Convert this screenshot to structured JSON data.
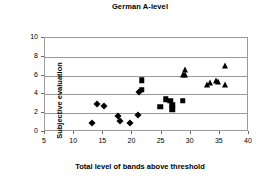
{
  "chart_data": {
    "type": "scatter",
    "title": "German A-level",
    "xlabel": "Total level of bands above threshold",
    "ylabel": "Subjective evaluation",
    "xlim": [
      5,
      40
    ],
    "ylim": [
      0,
      10
    ],
    "xticks": [
      5,
      10,
      15,
      20,
      25,
      30,
      35,
      40
    ],
    "yticks": [
      0,
      2,
      4,
      6,
      8,
      10
    ],
    "grid": "horizontal",
    "legend": "none",
    "series": [
      {
        "name": "diamond-group",
        "marker": "diamond",
        "points": [
          [
            13.0,
            1.0
          ],
          [
            14.0,
            3.0
          ],
          [
            15.2,
            2.8
          ],
          [
            17.6,
            1.7
          ],
          [
            17.9,
            1.2
          ],
          [
            19.5,
            1.0
          ],
          [
            20.9,
            1.8
          ],
          [
            21.1,
            4.3
          ]
        ]
      },
      {
        "name": "square-group",
        "marker": "square",
        "points": [
          [
            21.6,
            5.5
          ],
          [
            21.6,
            4.5
          ],
          [
            24.8,
            2.7
          ],
          [
            25.7,
            3.5
          ],
          [
            26.5,
            3.3
          ],
          [
            26.8,
            2.9
          ],
          [
            26.8,
            2.4
          ],
          [
            28.6,
            3.3
          ]
        ]
      },
      {
        "name": "triangle-group",
        "marker": "triangle",
        "points": [
          [
            28.7,
            6.1
          ],
          [
            29.0,
            6.6
          ],
          [
            29.1,
            6.1
          ],
          [
            32.8,
            5.0
          ],
          [
            33.3,
            5.2
          ],
          [
            34.3,
            5.4
          ],
          [
            34.6,
            5.3
          ],
          [
            35.8,
            5.0
          ],
          [
            35.9,
            7.0
          ]
        ]
      }
    ]
  }
}
